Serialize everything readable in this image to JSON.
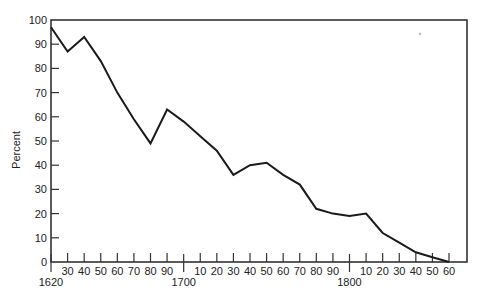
{
  "chart_data": {
    "type": "line",
    "title": "",
    "xlabel": "",
    "ylabel": "Percent",
    "ylim": [
      0,
      100
    ],
    "xlim": [
      1620,
      1860
    ],
    "grid": false,
    "legend": null,
    "y_ticks": [
      0,
      10,
      20,
      30,
      40,
      50,
      60,
      70,
      80,
      90,
      100
    ],
    "x_ticks": [
      {
        "year": 1620,
        "label": "",
        "major_label": "1620"
      },
      {
        "year": 1630,
        "label": "30"
      },
      {
        "year": 1640,
        "label": "40"
      },
      {
        "year": 1650,
        "label": "50"
      },
      {
        "year": 1660,
        "label": "60"
      },
      {
        "year": 1670,
        "label": "70"
      },
      {
        "year": 1680,
        "label": "80"
      },
      {
        "year": 1690,
        "label": "90"
      },
      {
        "year": 1700,
        "label": "",
        "major_label": "1700"
      },
      {
        "year": 1710,
        "label": "10"
      },
      {
        "year": 1720,
        "label": "20"
      },
      {
        "year": 1730,
        "label": "30"
      },
      {
        "year": 1740,
        "label": "40"
      },
      {
        "year": 1750,
        "label": "50"
      },
      {
        "year": 1760,
        "label": "60"
      },
      {
        "year": 1770,
        "label": "70"
      },
      {
        "year": 1780,
        "label": "80"
      },
      {
        "year": 1790,
        "label": "90"
      },
      {
        "year": 1800,
        "label": "",
        "major_label": "1800"
      },
      {
        "year": 1810,
        "label": "10"
      },
      {
        "year": 1820,
        "label": "20"
      },
      {
        "year": 1830,
        "label": "30"
      },
      {
        "year": 1840,
        "label": "40"
      },
      {
        "year": 1850,
        "label": "50"
      },
      {
        "year": 1860,
        "label": "60"
      }
    ],
    "series": [
      {
        "name": "Percent",
        "color": "#1a1a1a",
        "x": [
          1620,
          1630,
          1640,
          1650,
          1660,
          1670,
          1680,
          1690,
          1700,
          1710,
          1720,
          1730,
          1740,
          1750,
          1760,
          1770,
          1780,
          1790,
          1800,
          1810,
          1820,
          1830,
          1840,
          1850,
          1860
        ],
        "values": [
          97,
          87,
          93,
          83,
          70,
          59,
          49,
          63,
          58,
          52,
          46,
          36,
          40,
          41,
          36,
          32,
          22,
          20,
          19,
          20,
          12,
          8,
          4,
          2,
          0
        ]
      }
    ]
  },
  "style": {
    "line_color": "#1a1a1a",
    "axis_color": "#333333",
    "background": "#ffffff"
  }
}
